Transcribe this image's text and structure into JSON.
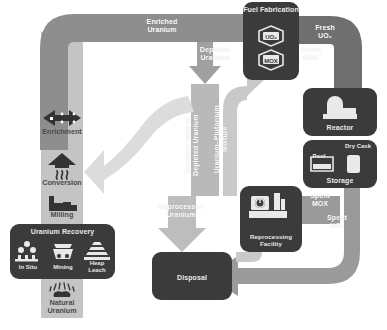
{
  "diagram": {
    "colors": {
      "box_fill": "#3b3b3b",
      "arrow_dark": "#8e8e8e",
      "arrow_mid": "#a8a8a8",
      "arrow_light": "#c9c9c9",
      "arrow_pale": "#d9d9d9",
      "column_band": "#c4c4c4",
      "label_light": "#ffffff",
      "label_dark": "#5f5f5f",
      "background": "#ffffff"
    }
  },
  "facilities": {
    "fuel_fabrication": {
      "label": "Fuel\nFabrication",
      "items": [
        {
          "label": "UO₂",
          "icon": "fuel-pellet-icon"
        },
        {
          "label": "MOX",
          "icon": "fuel-pellet-icon"
        }
      ]
    },
    "reactor": {
      "label": "Reactor",
      "icon": "reactor-containment-icon"
    },
    "storage": {
      "label": "Storage",
      "pool_label": "Pool",
      "dry_cask_label": "Dry Cask",
      "pool_icon": "spent-fuel-pool-icon",
      "dry_cask_icon": "dry-cask-icon"
    },
    "reprocessing": {
      "label": "Reprocessing\nFacility",
      "icon": "reprocessing-plant-icon"
    },
    "disposal": {
      "label": "Disposal"
    },
    "uranium_recovery": {
      "label": "Uranium Recovery",
      "items": [
        {
          "label": "In Situ",
          "icon": "in-situ-wells-icon"
        },
        {
          "label": "Mining",
          "icon": "mine-cart-icon"
        },
        {
          "label": "Heap\nLeach",
          "icon": "heap-leach-icon"
        }
      ]
    }
  },
  "processes": [
    {
      "key": "enrichment",
      "label": "Enrichment",
      "icon": "centrifuge-arrows-icon"
    },
    {
      "key": "conversion",
      "label": "Conversion",
      "icon": "conversion-heat-arrow-icon"
    },
    {
      "key": "milling",
      "label": "Milling",
      "icon": "mill-factory-icon"
    },
    {
      "key": "natural_uranium",
      "label": "Natural\nUranium",
      "icon": "uranium-ore-icon"
    }
  ],
  "flow_labels": {
    "enriched_uranium": "Enriched\nUranium",
    "depleted_uranium": "Depleted\nUranium",
    "deconversion": "Deconversion of\nDepleted Uranium",
    "uranium_plutonium_mixture": "Uranium–Plutonium\nMixture",
    "fresh_uo2": "Fresh\nUO₂",
    "fresh_mox": "Fresh\nMOX",
    "spent_mox": "Spent\nMOX",
    "spent_uo2": "Spent\nUO₂",
    "reprocessed_uranium": "Reprocessed\nUranium"
  }
}
